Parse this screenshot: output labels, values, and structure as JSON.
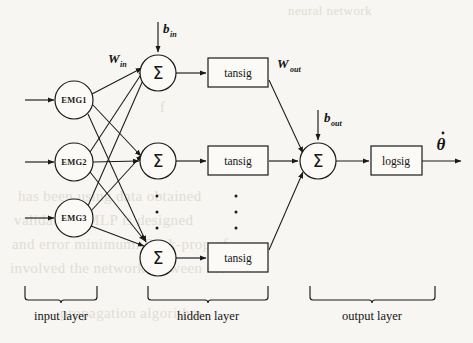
{
  "figure": {
    "type": "neural-network-architecture-diagram",
    "background_color": "#f7f6f2",
    "ink_color": "#1a1a1a"
  },
  "input_layer": {
    "caption": "input layer",
    "nodes": [
      {
        "label": "EMG1",
        "cx": 74,
        "cy": 100,
        "r": 19
      },
      {
        "label": "EMG2",
        "cx": 74,
        "cy": 162,
        "r": 19
      },
      {
        "label": "EMG3",
        "cx": 74,
        "cy": 218,
        "r": 19
      }
    ],
    "brace": {
      "x1": 25,
      "x2": 97,
      "y": 292
    }
  },
  "hidden_layer": {
    "caption": "hidden layer",
    "sum_glyph": "Σ",
    "nodes": [
      {
        "label": "Σ",
        "cx": 158,
        "cy": 73,
        "r": 18
      },
      {
        "label": "Σ",
        "cx": 158,
        "cy": 161,
        "r": 18
      },
      {
        "label": "Σ",
        "cx": 158,
        "cy": 258,
        "r": 18
      }
    ],
    "activation_boxes": [
      {
        "label": "tansig",
        "x": 208,
        "y": 58,
        "w": 60,
        "h": 29
      },
      {
        "label": "tansig",
        "x": 208,
        "y": 146,
        "w": 60,
        "h": 29
      },
      {
        "label": "tansig",
        "x": 208,
        "y": 243,
        "w": 60,
        "h": 29
      }
    ],
    "ellipsis_columns": [
      {
        "cx": 157,
        "ys": [
          196,
          212,
          228
        ]
      },
      {
        "cx": 236,
        "ys": [
          196,
          212,
          228
        ]
      }
    ],
    "brace": {
      "x1": 148,
      "x2": 268,
      "y": 292
    }
  },
  "output_layer": {
    "caption": "output layer",
    "sum_node": {
      "label": "Σ",
      "cx": 318,
      "cy": 161,
      "r": 18
    },
    "activation_box": {
      "label": "logsig",
      "x": 371,
      "y": 146,
      "w": 51,
      "h": 29
    },
    "brace": {
      "x1": 310,
      "x2": 435,
      "y": 292
    }
  },
  "weights": {
    "input_to_hidden": {
      "base": "W",
      "sub": "in",
      "x": 108,
      "y": 63
    },
    "hidden_to_output": {
      "base": "W",
      "sub": "out",
      "x": 277,
      "y": 68
    }
  },
  "biases": {
    "hidden": {
      "base": "b",
      "sub": "in",
      "x": 163,
      "y": 33,
      "arrow_x": 158,
      "arrow_y1": 22,
      "arrow_y2": 52
    },
    "output": {
      "base": "b",
      "sub": "out",
      "x": 324,
      "y": 122,
      "arrow_x": 318,
      "arrow_y1": 110,
      "arrow_y2": 140
    }
  },
  "output_signal": {
    "symbol": "θ",
    "dot_accent": true,
    "label_x": 441,
    "label_y": 150,
    "arrow_x1": 422,
    "arrow_x2": 461,
    "arrow_y": 161
  },
  "input_arrows": [
    {
      "x1": 25,
      "x2": 54,
      "y": 100
    },
    {
      "x1": 25,
      "x2": 54,
      "y": 162
    },
    {
      "x1": 25,
      "x2": 54,
      "y": 218
    }
  ],
  "ghost_text": {
    "note": "faint bleed-through text from reverse page",
    "lines": [
      {
        "text": "neural network",
        "x": 288,
        "y": 3,
        "size": 13
      },
      {
        "text": "f",
        "x": 160,
        "y": 100,
        "size": 14
      },
      {
        "text": "has been using data obtained",
        "x": 18,
        "y": 188,
        "size": 15
      },
      {
        "text": "validation. MLP is designed",
        "x": 14,
        "y": 212,
        "size": 15
      },
      {
        "text": "and error minimum. Back-prop of",
        "x": 12,
        "y": 236,
        "size": 15
      },
      {
        "text": "involved the network between the",
        "x": 10,
        "y": 260,
        "size": 15
      },
      {
        "text": "propagation algorithm",
        "x": 60,
        "y": 305,
        "size": 15
      }
    ]
  }
}
